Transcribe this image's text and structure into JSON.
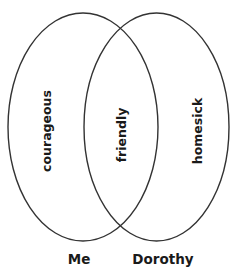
{
  "diagram": {
    "type": "venn",
    "stroke_color": "#333333",
    "sets": [
      {
        "id": "me",
        "label": "Me",
        "unique_trait": "courageous"
      },
      {
        "id": "dorothy",
        "label": "Dorothy",
        "unique_trait": "homesick"
      }
    ],
    "intersection": {
      "trait": "friendly"
    }
  }
}
